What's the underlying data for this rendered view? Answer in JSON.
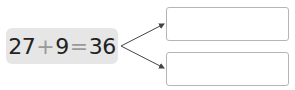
{
  "equation": {
    "left": "27",
    "plus": "+",
    "addend": "9",
    "equals": "=",
    "result": "36"
  },
  "answer_boxes": [
    {
      "value": ""
    },
    {
      "value": ""
    }
  ],
  "colors": {
    "equation_bg": "#e6e6e6",
    "operator": "#9a9a9a",
    "box_border": "#b5b5b5",
    "arrow": "#444444"
  }
}
